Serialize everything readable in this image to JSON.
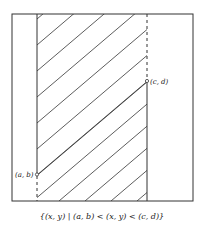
{
  "diagram": {
    "point_lower_label": "(a, b)",
    "point_upper_label": "(c, d)",
    "caption": "{(x, y) | (a, b) < (x, y) < (c, d)}",
    "region": "shaded vertical strip between x = a and x = c, with the line x = a included above (a, b) and the line x = c included below (c, d)",
    "stroke_color": "#333333"
  }
}
